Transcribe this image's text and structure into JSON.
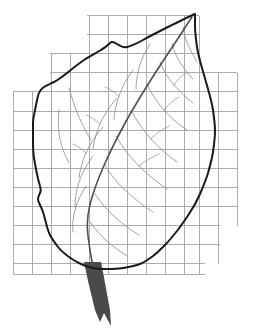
{
  "figure": {
    "width": 254,
    "height": 333,
    "background_color": "#ffffff"
  },
  "colors": {
    "background": "#ffffff",
    "grid_line": "#a3a3a3",
    "leaf_outline": "#1a1a1a",
    "leaf_midrib": "#4f4f4f",
    "leaf_vein": "#8c8c8c",
    "petiole_fill": "#4a4a4a"
  },
  "grid": {
    "label": "square grid overlay",
    "cell_size": 19.1,
    "stroke_width": 0.9,
    "rows": [
      {
        "label": "grid-row-1",
        "y": 15.5,
        "x_start": 87,
        "x_end": 199
      },
      {
        "label": "grid-row-2",
        "y": 34.6,
        "x_start": 87,
        "x_end": 199
      },
      {
        "label": "grid-row-3",
        "y": 53.7,
        "x_start": 50,
        "x_end": 199
      },
      {
        "label": "grid-row-4",
        "y": 72.8,
        "x_start": 50,
        "x_end": 237
      },
      {
        "label": "grid-row-5",
        "y": 91.9,
        "x_start": 13,
        "x_end": 237
      },
      {
        "label": "grid-row-6",
        "y": 111.0,
        "x_start": 13,
        "x_end": 237
      },
      {
        "label": "grid-row-7",
        "y": 130.1,
        "x_start": 13,
        "x_end": 237
      },
      {
        "label": "grid-row-8",
        "y": 149.2,
        "x_start": 13,
        "x_end": 237
      },
      {
        "label": "grid-row-9",
        "y": 168.3,
        "x_start": 13,
        "x_end": 237
      },
      {
        "label": "grid-row-10",
        "y": 187.4,
        "x_start": 13,
        "x_end": 237
      },
      {
        "label": "grid-row-11",
        "y": 206.5,
        "x_start": 13,
        "x_end": 237
      },
      {
        "label": "grid-row-12",
        "y": 225.6,
        "x_start": 13,
        "x_end": 220
      },
      {
        "label": "grid-row-13",
        "y": 244.7,
        "x_start": 13,
        "x_end": 220
      },
      {
        "label": "grid-row-14",
        "y": 263.8,
        "x_start": 13,
        "x_end": 205
      },
      {
        "label": "grid-row-15",
        "y": 274.0,
        "x_start": 13,
        "x_end": 205
      }
    ],
    "columns": [
      {
        "label": "grid-col-1",
        "x": 13.0,
        "y_start": 91.9,
        "y_end": 274.0
      },
      {
        "label": "grid-col-2",
        "x": 32.1,
        "y_start": 91.9,
        "y_end": 274.0
      },
      {
        "label": "grid-col-3",
        "x": 51.2,
        "y_start": 53.7,
        "y_end": 274.0
      },
      {
        "label": "grid-col-4",
        "x": 70.3,
        "y_start": 53.7,
        "y_end": 274.0
      },
      {
        "label": "grid-col-5",
        "x": 89.4,
        "y_start": 15.5,
        "y_end": 274.0
      },
      {
        "label": "grid-col-6",
        "x": 108.5,
        "y_start": 15.5,
        "y_end": 274.0
      },
      {
        "label": "grid-col-7",
        "x": 127.6,
        "y_start": 15.5,
        "y_end": 274.0
      },
      {
        "label": "grid-col-8",
        "x": 146.7,
        "y_start": 15.5,
        "y_end": 274.0
      },
      {
        "label": "grid-col-9",
        "x": 165.8,
        "y_start": 15.5,
        "y_end": 274.0
      },
      {
        "label": "grid-col-10",
        "x": 184.9,
        "y_start": 15.5,
        "y_end": 274.0
      },
      {
        "label": "grid-col-11",
        "x": 199.0,
        "y_start": 15.5,
        "y_end": 274.0
      },
      {
        "label": "grid-col-12",
        "x": 218.0,
        "y_start": 72.8,
        "y_end": 263.8
      },
      {
        "label": "grid-col-13",
        "x": 237.0,
        "y_start": 72.8,
        "y_end": 225.6
      }
    ]
  },
  "leaf": {
    "outline_label": "leaf blade margin",
    "outline_stroke_width": 2.0,
    "outline_path": "M 195 14 C 188 17 178 22 168 27 C 158 32 150 36 143 40 C 136 44 131 46 127 47 C 123 48 120 46 117 44 C 114 42 112 41 110 43 C 108 45 105 48 101 50 C 96 53 90 56 84 60 C 78 64 72 69 67 73 C 62 77 58 80 54 82 C 50 84 47 85 44 87 C 41 89 39 92 38 96 C 37 100 36 105 35 110 C 34 115 33 119 33 124 C 33 129 33 134 33 140 C 33 146 33 152 34 158 C 35 164 36 169 37 174 C 38 179 39 183 40 186 C 41 189 41 191 40 193 C 39 195 38 197 38 199 C 38 201 39 203 40 205 C 41 207 42 209 43 212 C 44 215 45 219 46 223 C 47 227 48 231 50 235 C 52 239 55 243 58 247 C 61 251 65 254 69 257 C 73 260 77 262 81 264 C 85 266 89 267 93 268 C 97 269 101 269 106 269 C 111 269 117 269 123 268 C 129 267 135 266 140 264 C 145 262 149 259 153 256 C 157 253 161 249 165 245 C 169 241 173 236 177 231 C 181 226 185 220 189 214 C 193 208 197 201 200 194 C 203 187 206 180 208 173 C 210 166 212 159 213 152 C 214 145 215 138 215 131 C 215 124 214 117 213 110 C 212 103 210 96 208 89 C 206 82 204 75 202 68 C 200 61 198 54 197 47 C 196 40 195 33 195 26 C 195 22 195 18 195 14 Z",
    "midrib_label": "midrib (primary vein)",
    "midrib_stroke_width": 1.6,
    "midrib_path": "M 192 17 C 186 26 179 37 171 49 C 163 61 155 73 147 86 C 139 99 131 112 124 125 C 117 138 111 150 106 161 C 101 172 97 182 94 191 C 91 200 89 208 88 215 C 87 222 87 229 88 236 C 89 243 90 251 92 262 C 93 267 94 271 95 274",
    "petiole_label": "petiole (leaf stalk)",
    "petiole_path": "M 84 262 L 101 262 L 103 272 L 110 310 L 111 326 L 104 313 L 100 322 L 95 310 L 88 281 Z",
    "veins": [
      {
        "label": "vein-right-1",
        "stroke_width": 0.8,
        "path": "M 183 27 C 184 34 186 41 189 47 C 192 53 195 58 197 62"
      },
      {
        "label": "vein-right-2",
        "stroke_width": 0.8,
        "path": "M 172 44 C 174 51 177 58 181 64 C 185 70 189 75 193 79"
      },
      {
        "label": "vein-right-3",
        "stroke_width": 0.8,
        "path": "M 160 62 C 163 70 168 78 174 85 C 180 92 187 98 193 103"
      },
      {
        "label": "vein-right-4",
        "stroke_width": 0.8,
        "path": "M 147 84 C 151 93 157 102 164 110 C 171 118 179 125 187 130"
      },
      {
        "label": "vein-right-5",
        "stroke_width": 0.8,
        "path": "M 131 110 C 136 120 143 130 151 139 C 159 148 168 156 177 162"
      },
      {
        "label": "vein-right-6",
        "stroke_width": 0.8,
        "path": "M 116 136 C 122 147 130 157 139 166 C 148 175 158 183 167 189"
      },
      {
        "label": "vein-right-7",
        "stroke_width": 0.8,
        "path": "M 104 164 C 110 174 118 184 127 192 C 136 200 145 207 153 212"
      },
      {
        "label": "vein-right-8",
        "stroke_width": 0.8,
        "path": "M 95 194 C 101 203 108 211 116 218 C 124 225 132 231 139 235"
      },
      {
        "label": "vein-right-9",
        "stroke_width": 0.8,
        "path": "M 90 222 C 95 229 101 236 108 242 C 115 248 121 252 127 256"
      },
      {
        "label": "vein-left-1",
        "stroke_width": 0.8,
        "path": "M 150 44 C 145 52 141 60 139 68 C 137 76 136 83 136 89"
      },
      {
        "label": "vein-left-2",
        "stroke_width": 0.8,
        "path": "M 133 70 C 127 78 122 87 119 96 C 116 105 114 113 114 120"
      },
      {
        "label": "vein-left-3",
        "stroke_width": 0.8,
        "path": "M 117 98 C 110 106 104 115 100 124 C 96 133 94 141 93 149"
      },
      {
        "label": "vein-left-4",
        "stroke_width": 0.8,
        "path": "M 103 127 C 96 135 90 144 86 153 C 82 162 80 170 79 178"
      },
      {
        "label": "vein-left-5",
        "stroke_width": 0.8,
        "path": "M 93 156 C 87 164 82 173 79 182 C 76 191 75 199 75 207"
      },
      {
        "label": "vein-left-6",
        "stroke_width": 0.8,
        "path": "M 86 186 C 81 194 77 202 75 210 C 73 218 72 225 73 232"
      },
      {
        "label": "vein-left-7",
        "stroke_width": 0.8,
        "path": "M 59 110 C 58 120 58 130 60 139 C 62 148 65 156 69 163"
      },
      {
        "label": "vein-left-8",
        "stroke_width": 0.8,
        "path": "M 69 88 C 72 98 75 108 79 117 C 83 126 87 134 91 140"
      },
      {
        "label": "vein-sub-right-1",
        "stroke_width": 0.7,
        "path": "M 174 85 C 177 80 181 76 186 73"
      },
      {
        "label": "vein-sub-right-2",
        "stroke_width": 0.7,
        "path": "M 164 110 C 168 105 173 100 179 97"
      },
      {
        "label": "vein-sub-right-3",
        "stroke_width": 0.7,
        "path": "M 151 139 C 156 134 162 129 169 126"
      },
      {
        "label": "vein-sub-right-4",
        "stroke_width": 0.7,
        "path": "M 139 166 C 145 161 152 157 159 154"
      },
      {
        "label": "vein-sub-left-1",
        "stroke_width": 0.7,
        "path": "M 119 96 C 115 92 110 89 105 87"
      },
      {
        "label": "vein-sub-left-2",
        "stroke_width": 0.7,
        "path": "M 100 124 C 96 120 91 117 86 115"
      },
      {
        "label": "vein-sub-left-3",
        "stroke_width": 0.7,
        "path": "M 86 153 C 82 149 78 146 73 144"
      }
    ]
  }
}
